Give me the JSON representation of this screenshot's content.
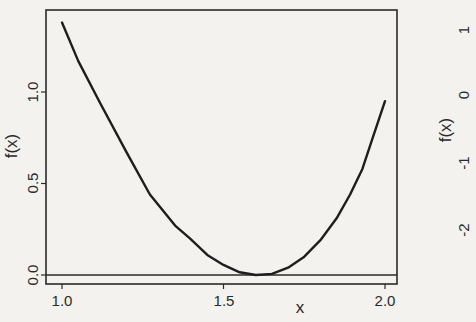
{
  "chart_data": [
    {
      "type": "line",
      "title": "",
      "xlabel": "x",
      "ylabel": "f(x)",
      "xlim": [
        0.98,
        2.04
      ],
      "ylim": [
        -0.05,
        1.45
      ],
      "x_ticks": [
        "1.0",
        "1.5",
        "2.0"
      ],
      "y_ticks": [
        "0.0",
        "0.5",
        "1.0"
      ],
      "grid": false,
      "legend": null,
      "reference_line": {
        "y": 0,
        "label": ""
      },
      "series": [
        {
          "name": "f(x)",
          "x": [
            1.0,
            1.05,
            1.118,
            1.2,
            1.272,
            1.35,
            1.396,
            1.45,
            1.5,
            1.55,
            1.6,
            1.65,
            1.7,
            1.75,
            1.8,
            1.85,
            1.892,
            1.93,
            1.96,
            2.0
          ],
          "y": [
            1.38,
            1.17,
            0.94,
            0.67,
            0.44,
            0.27,
            0.2,
            0.11,
            0.055,
            0.015,
            0.0,
            0.006,
            0.04,
            0.1,
            0.19,
            0.31,
            0.44,
            0.58,
            0.74,
            0.95
          ]
        }
      ]
    },
    {
      "type": "line",
      "partial": true,
      "xlabel": "",
      "ylabel": "f(x)",
      "y_ticks": [
        "-2",
        "-1",
        "0",
        "1"
      ],
      "series": []
    }
  ],
  "labels": {
    "x_axis": "x",
    "y_axis": "f(x)",
    "x_ticks": [
      "1.0",
      "1.5",
      "2.0"
    ],
    "y_ticks": [
      "0.0",
      "0.5",
      "1.0"
    ],
    "right_panel_y_axis": "f(x)",
    "right_panel_y_ticks": [
      "1",
      "0",
      "-1",
      "-2"
    ]
  },
  "colors": {
    "background": "#f3f2ef",
    "ink": "#2a2a2a"
  }
}
